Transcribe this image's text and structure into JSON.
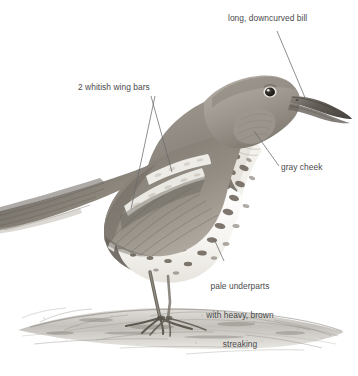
{
  "figure": {
    "kind": "field-guide-bird-illustration",
    "background_color": "#ffffff",
    "label_color": "#4a4a4c",
    "leader_line_color": "#5a5a5c"
  },
  "annotations": [
    {
      "id": "bill",
      "text": "long, downcurved bill",
      "lines": [
        "long, downcurved bill"
      ],
      "align": "left",
      "leader": "from label bottom-left down-right to bill"
    },
    {
      "id": "wing-bars",
      "text": "2 whitish wing bars",
      "lines": [
        "2 whitish wing bars"
      ],
      "align": "left",
      "leader": "two lines forming a V down to upper and lower wing bars"
    },
    {
      "id": "cheek",
      "text": "gray cheek",
      "lines": [
        "gray cheek"
      ],
      "align": "left",
      "leader": "from label top-left up to gray cheek patch"
    },
    {
      "id": "underparts",
      "text": "pale underparts with heavy, brown streaking",
      "lines": [
        "pale underparts",
        "with heavy, brown",
        "streaking"
      ],
      "align": "center",
      "leader": "from label top up-left to spotted belly"
    }
  ],
  "palette": {
    "upperparts_dark": "#6f6a64",
    "upperparts_mid": "#8d877f",
    "upperparts_light": "#b3ada4",
    "cheek_gray": "#9a958f",
    "underparts_pale": "#f4f2ee",
    "streak_brown": "#73695f",
    "bill_dark": "#56514b",
    "leg_gray": "#7d776f",
    "ground_gray": "#9e9a94",
    "eye_dark": "#2b2724"
  }
}
